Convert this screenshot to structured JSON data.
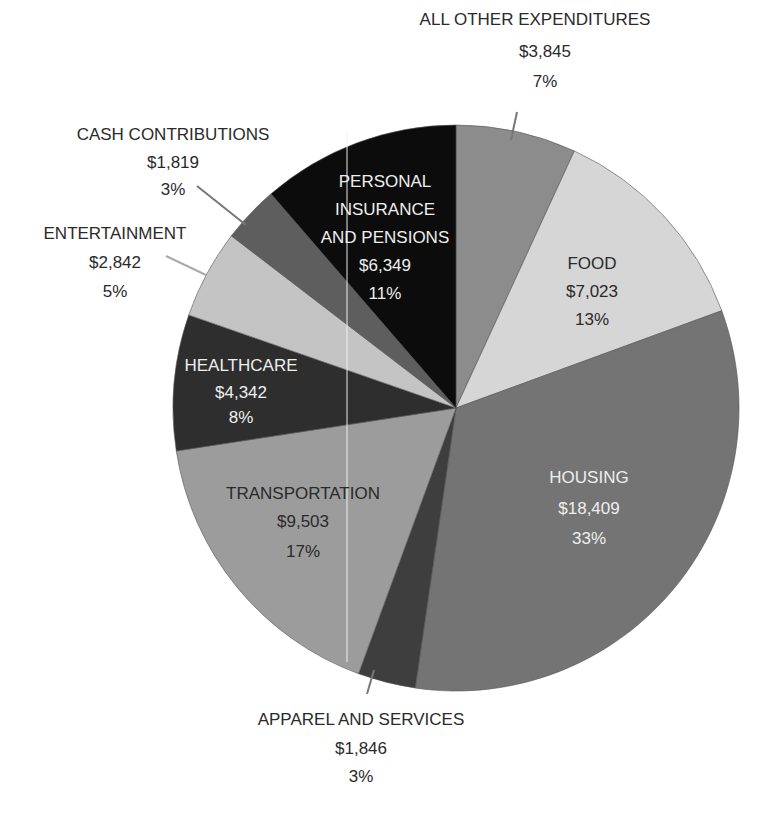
{
  "chart_data": {
    "type": "pie",
    "title": "",
    "start_angle_deg": 0,
    "direction": "clockwise",
    "total": 55978,
    "slices": [
      {
        "key": "other",
        "label": "ALL OTHER EXPENDITURES",
        "value": 3845,
        "value_label": "$3,845",
        "percent": 7,
        "percent_label": "7%",
        "color": "#8c8c8c",
        "label_position": "outside"
      },
      {
        "key": "food",
        "label": "FOOD",
        "value": 7023,
        "value_label": "$7,023",
        "percent": 13,
        "percent_label": "13%",
        "color": "#d6d6d6",
        "label_position": "inside"
      },
      {
        "key": "housing",
        "label": "HOUSING",
        "value": 18409,
        "value_label": "$18,409",
        "percent": 33,
        "percent_label": "33%",
        "color": "#747474",
        "label_position": "inside"
      },
      {
        "key": "apparel",
        "label": "APPAREL AND SERVICES",
        "value": 1846,
        "value_label": "$1,846",
        "percent": 3,
        "percent_label": "3%",
        "color": "#3e3e3e",
        "label_position": "outside"
      },
      {
        "key": "transportation",
        "label": "TRANSPORTATION",
        "value": 9503,
        "value_label": "$9,503",
        "percent": 17,
        "percent_label": "17%",
        "color": "#9c9c9c",
        "label_position": "inside"
      },
      {
        "key": "healthcare",
        "label": "HEALTHCARE",
        "value": 4342,
        "value_label": "$4,342",
        "percent": 8,
        "percent_label": "8%",
        "color": "#2e2e2e",
        "label_position": "inside"
      },
      {
        "key": "entertainment",
        "label": "ENTERTAINMENT",
        "value": 2842,
        "value_label": "$2,842",
        "percent": 5,
        "percent_label": "5%",
        "color": "#c4c4c4",
        "label_position": "outside"
      },
      {
        "key": "cash",
        "label": "CASH CONTRIBUTIONS",
        "value": 1819,
        "value_label": "$1,819",
        "percent": 3,
        "percent_label": "3%",
        "color": "#5e5e5e",
        "label_position": "outside"
      },
      {
        "key": "personal",
        "label": "PERSONAL INSURANCE AND PENSIONS",
        "label_lines": [
          "PERSONAL",
          "INSURANCE",
          "AND PENSIONS"
        ],
        "value": 6349,
        "value_label": "$6,349",
        "percent": 11,
        "percent_label": "11%",
        "color": "#0c0c0c",
        "label_position": "inside"
      }
    ],
    "legend": "none",
    "grid": false
  },
  "labels": {
    "other": {
      "name": "ALL OTHER EXPENDITURES",
      "amount": "$3,845",
      "pct": "7%"
    },
    "food": {
      "name": "FOOD",
      "amount": "$7,023",
      "pct": "13%"
    },
    "housing": {
      "name": "HOUSING",
      "amount": "$18,409",
      "pct": "33%"
    },
    "apparel": {
      "name": "APPAREL AND SERVICES",
      "amount": "$1,846",
      "pct": "3%"
    },
    "transportation": {
      "name": "TRANSPORTATION",
      "amount": "$9,503",
      "pct": "17%"
    },
    "healthcare": {
      "name": "HEALTHCARE",
      "amount": "$4,342",
      "pct": "8%"
    },
    "entertainment": {
      "name": "ENTERTAINMENT",
      "amount": "$2,842",
      "pct": "5%"
    },
    "cash": {
      "name": "CASH CONTRIBUTIONS",
      "amount": "$1,819",
      "pct": "3%"
    },
    "personal": {
      "line1": "PERSONAL",
      "line2": "INSURANCE",
      "line3": "AND PENSIONS",
      "amount": "$6,349",
      "pct": "11%"
    }
  }
}
